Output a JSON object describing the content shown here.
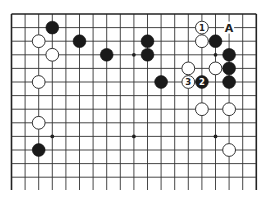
{
  "diagram": {
    "type": "go-board-partial",
    "board_size": 19,
    "visible_columns": 19,
    "visible_rows": 13,
    "edges": {
      "top": true,
      "left": true,
      "right": true,
      "bottom": false
    },
    "hoshi": [
      [
        3,
        3
      ],
      [
        9,
        3
      ],
      [
        15,
        3
      ],
      [
        3,
        9
      ],
      [
        9,
        9
      ],
      [
        15,
        9
      ]
    ],
    "stones": [
      {
        "color": "black",
        "col": 3,
        "row": 1,
        "label": ""
      },
      {
        "color": "white",
        "col": 2,
        "row": 2,
        "label": ""
      },
      {
        "color": "white",
        "col": 3,
        "row": 3,
        "label": ""
      },
      {
        "color": "black",
        "col": 5,
        "row": 2,
        "label": ""
      },
      {
        "color": "black",
        "col": 7,
        "row": 3,
        "label": ""
      },
      {
        "color": "black",
        "col": 10,
        "row": 2,
        "label": ""
      },
      {
        "color": "black",
        "col": 10,
        "row": 3,
        "label": ""
      },
      {
        "color": "white",
        "col": 14,
        "row": 1,
        "label": "1"
      },
      {
        "color": "white",
        "col": 14,
        "row": 2,
        "label": ""
      },
      {
        "color": "black",
        "col": 15,
        "row": 2,
        "label": ""
      },
      {
        "color": "black",
        "col": 16,
        "row": 3,
        "label": ""
      },
      {
        "color": "black",
        "col": 16,
        "row": 4,
        "label": ""
      },
      {
        "color": "black",
        "col": 16,
        "row": 5,
        "label": ""
      },
      {
        "color": "white",
        "col": 13,
        "row": 4,
        "label": ""
      },
      {
        "color": "white",
        "col": 15,
        "row": 4,
        "label": ""
      },
      {
        "color": "white",
        "col": 13,
        "row": 5,
        "label": "3"
      },
      {
        "color": "black",
        "col": 14,
        "row": 5,
        "label": "2"
      },
      {
        "color": "black",
        "col": 11,
        "row": 5,
        "label": ""
      },
      {
        "color": "white",
        "col": 2,
        "row": 5,
        "label": ""
      },
      {
        "color": "white",
        "col": 14,
        "row": 7,
        "label": ""
      },
      {
        "color": "white",
        "col": 16,
        "row": 7,
        "label": ""
      },
      {
        "color": "white",
        "col": 2,
        "row": 8,
        "label": ""
      },
      {
        "color": "black",
        "col": 2,
        "row": 10,
        "label": ""
      },
      {
        "color": "white",
        "col": 16,
        "row": 10,
        "label": ""
      }
    ],
    "point_labels": [
      {
        "text": "A",
        "col": 16,
        "row": 1
      }
    ]
  }
}
